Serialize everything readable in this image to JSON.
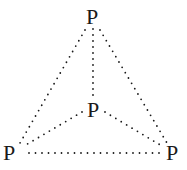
{
  "diagram": {
    "type": "molecular-structure",
    "atoms": [
      {
        "id": "top",
        "label": "P",
        "x": 93,
        "y": 24
      },
      {
        "id": "center",
        "label": "P",
        "x": 94,
        "y": 117
      },
      {
        "id": "bottom-left",
        "label": "P",
        "x": 11,
        "y": 160
      },
      {
        "id": "bottom-right",
        "label": "P",
        "x": 174,
        "y": 160
      }
    ],
    "bonds": [
      {
        "from": "top",
        "to": "bottom-left",
        "style": "dotted"
      },
      {
        "from": "top",
        "to": "bottom-right",
        "style": "dotted"
      },
      {
        "from": "top",
        "to": "center",
        "style": "dotted"
      },
      {
        "from": "center",
        "to": "bottom-left",
        "style": "dotted"
      },
      {
        "from": "center",
        "to": "bottom-right",
        "style": "dotted"
      },
      {
        "from": "bottom-left",
        "to": "bottom-right",
        "style": "dotted"
      }
    ],
    "colors": {
      "ink": "#1a1a1a",
      "background": "#ffffff"
    }
  }
}
